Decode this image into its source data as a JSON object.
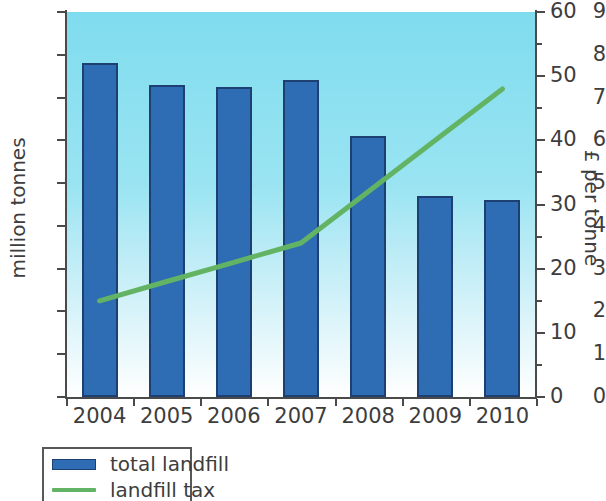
{
  "chart_data": {
    "type": "bar",
    "title": "",
    "subtitle": "",
    "categories": [
      "2004",
      "2005",
      "2006",
      "2007",
      "2008",
      "2009",
      "2010"
    ],
    "xlabel": "",
    "ylabel": "million tonnes",
    "ylabel_right": "£ per tonne",
    "ylim": [
      0,
      9
    ],
    "ylim_right": [
      0,
      60
    ],
    "yticks": [
      "0",
      "1",
      "2",
      "3",
      "4",
      "5",
      "6",
      "7",
      "8",
      "9"
    ],
    "yticks_right": [
      "0",
      "10",
      "20",
      "30",
      "40",
      "50",
      "60"
    ],
    "yticks_right_minor": [
      "5",
      "15",
      "25",
      "35",
      "45",
      "55"
    ],
    "grid": false,
    "legend_position": "below-left",
    "series": [
      {
        "name": "total landfill",
        "type": "bar",
        "axis": "left",
        "units": "million tonnes",
        "color": "#2e6db4",
        "edge_color": "#1d3f72",
        "values": [
          7.8,
          7.3,
          7.25,
          7.4,
          6.1,
          4.7,
          4.6
        ]
      },
      {
        "name": "landfill tax",
        "type": "line",
        "axis": "right",
        "units": "£ per tonne",
        "color": "#63b364",
        "values": [
          15,
          18,
          21,
          24,
          32,
          40,
          48
        ]
      }
    ],
    "plot_background": "#7fdcee",
    "plot_background_gradient": [
      "#7fdcee",
      "#ffffff"
    ],
    "axis_color": "#4a4a4a"
  },
  "legend": {
    "items": [
      {
        "label": "total landfill",
        "marker": "bar-swatch",
        "color": "#2e6db4"
      },
      {
        "label": "landfill tax",
        "marker": "line-swatch",
        "color": "#63b364"
      }
    ]
  }
}
